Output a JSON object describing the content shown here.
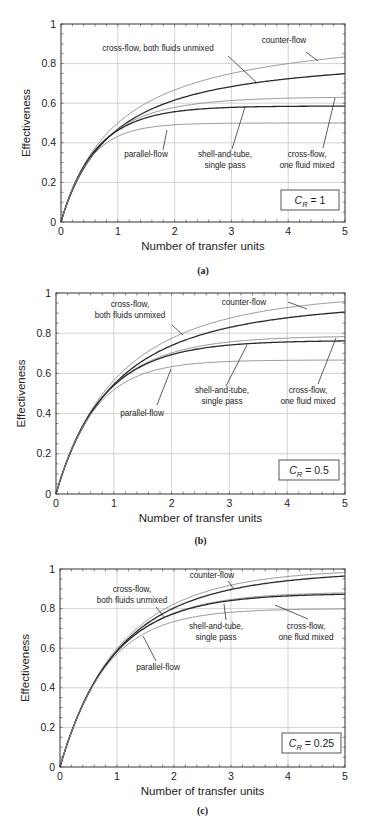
{
  "figure": {
    "panels": [
      {
        "id": "a",
        "sublabel": "(a)",
        "cr_label": "1",
        "ylabel": "Effectiveness",
        "xlabel": "Number of transfer units",
        "labels": {
          "counter": "counter-flow",
          "crossUnmixed": [
            "cross-flow, both fluids unmixed"
          ],
          "parallel": "parallel-flow",
          "shell": [
            "shell-and-tube,",
            "single pass"
          ],
          "crossMixed": [
            "cross-flow,",
            "one fluid mixed"
          ]
        }
      },
      {
        "id": "b",
        "sublabel": "(b)",
        "cr_label": "0.5",
        "ylabel": "Effectiveness",
        "xlabel": "Number of transfer units",
        "labels": {
          "counter": "counter-flow",
          "crossUnmixed": [
            "cross-flow,",
            "both fluids unmixed"
          ],
          "parallel": "parallel-flow",
          "shell": [
            "shell-and-tube,",
            "single pass"
          ],
          "crossMixed": [
            "cross-flow,",
            "one fluid mixed"
          ]
        }
      },
      {
        "id": "c",
        "sublabel": "(c)",
        "cr_label": "0.25",
        "ylabel": "Effectiveness",
        "xlabel": "Number of transfer units",
        "labels": {
          "counter": "counter-flow",
          "crossUnmixed": [
            "cross-flow,",
            "both fluids unmixed"
          ],
          "parallel": "parallel-flow",
          "shell": [
            "shell-and-tube,",
            "single pass"
          ],
          "crossMixed": [
            "cross-flow,",
            "one fluid mixed"
          ]
        }
      }
    ],
    "cr_prefix": "C",
    "cr_subscript": "R"
  },
  "chart_data": [
    {
      "type": "line",
      "title": "(a) C_R = 1",
      "xlabel": "Number of transfer units",
      "ylabel": "Effectiveness",
      "xlim": [
        0,
        5
      ],
      "ylim": [
        0,
        1
      ],
      "xticks": [
        0,
        1,
        2,
        3,
        4,
        5
      ],
      "yticks": [
        0,
        0.2,
        0.4,
        0.6,
        0.8,
        1
      ],
      "grid": true,
      "annotation": "C_R = 1",
      "x": [
        0,
        0.5,
        1,
        1.5,
        2,
        2.5,
        3,
        3.5,
        4,
        4.5,
        5
      ],
      "series": [
        {
          "name": "counter-flow",
          "values": [
            0,
            0.333,
            0.5,
            0.6,
            0.667,
            0.714,
            0.75,
            0.778,
            0.8,
            0.818,
            0.833
          ]
        },
        {
          "name": "cross-flow, both fluids unmixed",
          "values": [
            0,
            0.319,
            0.476,
            0.561,
            0.614,
            0.65,
            0.677,
            0.698,
            0.716,
            0.73,
            0.743
          ]
        },
        {
          "name": "cross-flow, one fluid mixed",
          "values": [
            0,
            0.325,
            0.468,
            0.537,
            0.574,
            0.596,
            0.608,
            0.615,
            0.62,
            0.622,
            0.624
          ]
        },
        {
          "name": "shell-and-tube, single pass",
          "values": [
            0,
            0.317,
            0.454,
            0.52,
            0.555,
            0.572,
            0.58,
            0.584,
            0.585,
            0.586,
            0.586
          ]
        },
        {
          "name": "parallel-flow",
          "values": [
            0,
            0.316,
            0.432,
            0.475,
            0.491,
            0.497,
            0.499,
            0.5,
            0.5,
            0.5,
            0.5
          ]
        }
      ]
    },
    {
      "type": "line",
      "title": "(b) C_R = 0.5",
      "xlabel": "Number of transfer units",
      "ylabel": "Effectiveness",
      "xlim": [
        0,
        5
      ],
      "ylim": [
        0,
        1
      ],
      "xticks": [
        0,
        1,
        2,
        3,
        4,
        5
      ],
      "yticks": [
        0,
        0.2,
        0.4,
        0.6,
        0.8,
        1
      ],
      "grid": true,
      "annotation": "C_R = 0.5",
      "x": [
        0,
        0.5,
        1,
        1.5,
        2,
        2.5,
        3,
        3.5,
        4,
        4.5,
        5
      ],
      "series": [
        {
          "name": "counter-flow",
          "values": [
            0,
            0.358,
            0.565,
            0.69,
            0.77,
            0.826,
            0.865,
            0.893,
            0.914,
            0.93,
            0.942
          ]
        },
        {
          "name": "cross-flow, both fluids unmixed",
          "values": [
            0,
            0.354,
            0.545,
            0.656,
            0.726,
            0.774,
            0.809,
            0.836,
            0.856,
            0.872,
            0.885
          ]
        },
        {
          "name": "cross-flow, one fluid mixed",
          "values": [
            0,
            0.358,
            0.547,
            0.646,
            0.704,
            0.737,
            0.756,
            0.767,
            0.773,
            0.777,
            0.779
          ]
        },
        {
          "name": "shell-and-tube, single pass",
          "values": [
            0,
            0.354,
            0.534,
            0.626,
            0.68,
            0.71,
            0.728,
            0.74,
            0.746,
            0.75,
            0.753
          ]
        },
        {
          "name": "parallel-flow",
          "values": [
            0,
            0.351,
            0.518,
            0.596,
            0.634,
            0.651,
            0.66,
            0.664,
            0.666,
            0.666,
            0.667
          ]
        }
      ]
    },
    {
      "type": "line",
      "title": "(c) C_R = 0.25",
      "xlabel": "Number of transfer units",
      "ylabel": "Effectiveness",
      "xlim": [
        0,
        5
      ],
      "ylim": [
        0,
        1
      ],
      "xticks": [
        0,
        1,
        2,
        3,
        4,
        5
      ],
      "yticks": [
        0,
        0.2,
        0.4,
        0.6,
        0.8,
        1
      ],
      "grid": true,
      "annotation": "C_R = 0.25",
      "x": [
        0,
        0.5,
        1,
        1.5,
        2,
        2.5,
        3,
        3.5,
        4,
        4.5,
        5
      ],
      "series": [
        {
          "name": "counter-flow",
          "values": [
            0,
            0.373,
            0.597,
            0.738,
            0.829,
            0.889,
            0.928,
            0.954,
            0.971,
            0.981,
            0.988
          ]
        },
        {
          "name": "cross-flow, both fluids unmixed",
          "values": [
            0,
            0.371,
            0.589,
            0.719,
            0.8,
            0.854,
            0.891,
            0.917,
            0.936,
            0.95,
            0.961
          ]
        },
        {
          "name": "cross-flow, one fluid mixed",
          "values": [
            0,
            0.374,
            0.59,
            0.718,
            0.793,
            0.837,
            0.862,
            0.877,
            0.886,
            0.891,
            0.894
          ]
        },
        {
          "name": "shell-and-tube, single pass",
          "values": [
            0,
            0.371,
            0.585,
            0.712,
            0.789,
            0.83,
            0.854,
            0.866,
            0.872,
            0.876,
            0.877
          ]
        },
        {
          "name": "parallel-flow",
          "values": [
            0,
            0.37,
            0.572,
            0.685,
            0.743,
            0.771,
            0.786,
            0.793,
            0.797,
            0.798,
            0.799
          ]
        }
      ]
    }
  ]
}
